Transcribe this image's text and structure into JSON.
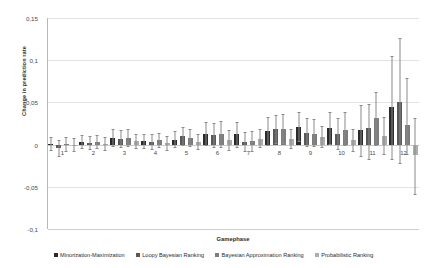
{
  "chart_data": {
    "type": "bar",
    "title": "",
    "xlabel": "Gamephase",
    "ylabel": "Change in prediction rate",
    "categories": [
      "1",
      "2",
      "3",
      "4",
      "5",
      "6",
      "7",
      "8",
      "9",
      "10",
      "11",
      "12"
    ],
    "ylim": [
      -0.1,
      0.15
    ],
    "ytick_labels": [
      "0,15",
      "0,1",
      "0,05",
      "0",
      "-0,05",
      "-0,1"
    ],
    "ytick_values": [
      0.15,
      0.1,
      0.05,
      0,
      -0.05,
      -0.1
    ],
    "grid": true,
    "legend_position": "bottom",
    "series": [
      {
        "name": "Minorization-Maximization",
        "color": "#2b2b2b",
        "values": [
          0.001,
          0.003,
          0.008,
          0.004,
          0.006,
          0.013,
          0.012,
          0.016,
          0.021,
          0.02,
          0.017,
          0.044
        ],
        "err_low": [
          -0.006,
          -0.004,
          -0.002,
          -0.004,
          -0.003,
          -0.001,
          -0.003,
          0.0,
          0.004,
          0.001,
          -0.013,
          -0.017
        ],
        "err_high": [
          0.009,
          0.011,
          0.018,
          0.013,
          0.016,
          0.027,
          0.027,
          0.033,
          0.039,
          0.039,
          0.047,
          0.105
        ]
      },
      {
        "name": "Loopy Bayesian Ranking",
        "color": "#595959",
        "values": [
          -0.004,
          0.002,
          0.007,
          0.003,
          0.01,
          0.011,
          0.003,
          0.018,
          0.014,
          0.013,
          0.02,
          0.051
        ],
        "err_low": [
          -0.013,
          -0.005,
          -0.003,
          -0.005,
          0.0,
          -0.003,
          -0.008,
          0.002,
          -0.002,
          -0.005,
          -0.017,
          -0.022
        ],
        "err_high": [
          0.005,
          0.01,
          0.017,
          0.012,
          0.021,
          0.026,
          0.015,
          0.035,
          0.031,
          0.032,
          0.048,
          0.126
        ]
      },
      {
        "name": "Bayesian Approximation Ranking",
        "color": "#7d7d7d",
        "values": [
          0.001,
          0.003,
          0.008,
          0.005,
          0.008,
          0.012,
          0.004,
          0.019,
          0.013,
          0.017,
          0.031,
          0.023
        ],
        "err_low": [
          -0.007,
          -0.004,
          -0.002,
          -0.003,
          -0.002,
          -0.003,
          -0.007,
          0.002,
          -0.002,
          -0.001,
          0.0,
          -0.011
        ],
        "err_high": [
          0.009,
          0.011,
          0.019,
          0.014,
          0.019,
          0.028,
          0.016,
          0.036,
          0.03,
          0.039,
          0.062,
          0.079
        ]
      },
      {
        "name": "Probabilistic Ranking",
        "color": "#adadad",
        "values": [
          0.0,
          0.001,
          0.004,
          0.002,
          0.003,
          0.005,
          0.007,
          0.007,
          0.009,
          0.005,
          0.01,
          -0.012
        ],
        "err_low": [
          -0.008,
          -0.006,
          -0.004,
          -0.006,
          -0.005,
          -0.006,
          -0.003,
          -0.004,
          -0.003,
          -0.007,
          -0.011,
          -0.058
        ],
        "err_high": [
          0.008,
          0.009,
          0.013,
          0.01,
          0.012,
          0.017,
          0.018,
          0.019,
          0.022,
          0.019,
          0.033,
          0.031
        ]
      }
    ]
  },
  "axes": {
    "y_title": "Change in prediction rate",
    "x_title": "Gamephase"
  },
  "legend": {
    "items": [
      {
        "label": "Minorization-Maximization",
        "color": "#2b2b2b"
      },
      {
        "label": "Loopy Bayesian Ranking",
        "color": "#595959"
      },
      {
        "label": "Bayesian Approximation Ranking",
        "color": "#7d7d7d"
      },
      {
        "label": "Probabilistic Ranking",
        "color": "#adadad"
      }
    ]
  }
}
